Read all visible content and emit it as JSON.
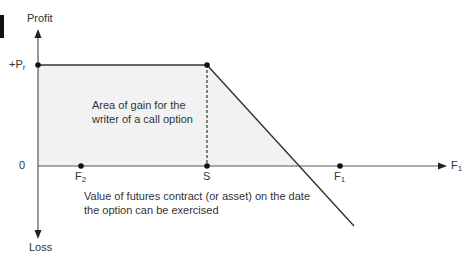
{
  "diagram": {
    "y_axis": {
      "top_label": "Profit",
      "bottom_label": "Loss"
    },
    "x_axis": {
      "label_main": "F",
      "label_sub": "1"
    },
    "y_ticks": [
      {
        "main": "+P",
        "sub": "r",
        "note": "premium received"
      },
      {
        "main": "0",
        "sub": ""
      }
    ],
    "x_points": [
      {
        "main": "F",
        "sub": "2"
      },
      {
        "main": "S",
        "sub": ""
      },
      {
        "main": "F",
        "sub": "1"
      }
    ],
    "area_label": "Area of gain for the writer of a call option",
    "x_description": "Value of futures contract (or asset) on the date the option can be exercised",
    "colors": {
      "line": "#333333",
      "fill": "#f2f2f2",
      "axis": "#555555"
    }
  }
}
